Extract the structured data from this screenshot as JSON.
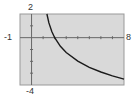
{
  "chart_data": {
    "type": "line",
    "title": "",
    "xlabel": "",
    "ylabel": "",
    "xlim": [
      -1,
      8
    ],
    "ylim": [
      -4,
      2
    ],
    "grid": false,
    "x_ticks": [
      1,
      2,
      3,
      4,
      5,
      6,
      7
    ],
    "y_ticks": [
      -3,
      -2,
      -1,
      1
    ],
    "tick_labels": {
      "x_min": "-1",
      "x_max": "8",
      "y_max": "2",
      "y_min": "-4"
    },
    "series": [
      {
        "name": "curve",
        "x": [
          1.33,
          1.5,
          1.75,
          2.0,
          2.5,
          3.0,
          4.0,
          5.0,
          6.0,
          7.0,
          8.0
        ],
        "y": [
          2.0,
          1.25,
          0.52,
          0.0,
          -0.73,
          -1.25,
          -1.98,
          -2.5,
          -2.9,
          -3.23,
          -3.5
        ]
      }
    ],
    "colors": {
      "plot_bg": "#d9d9d9",
      "curve": "#1a1a1a",
      "axes": "#666666"
    }
  }
}
